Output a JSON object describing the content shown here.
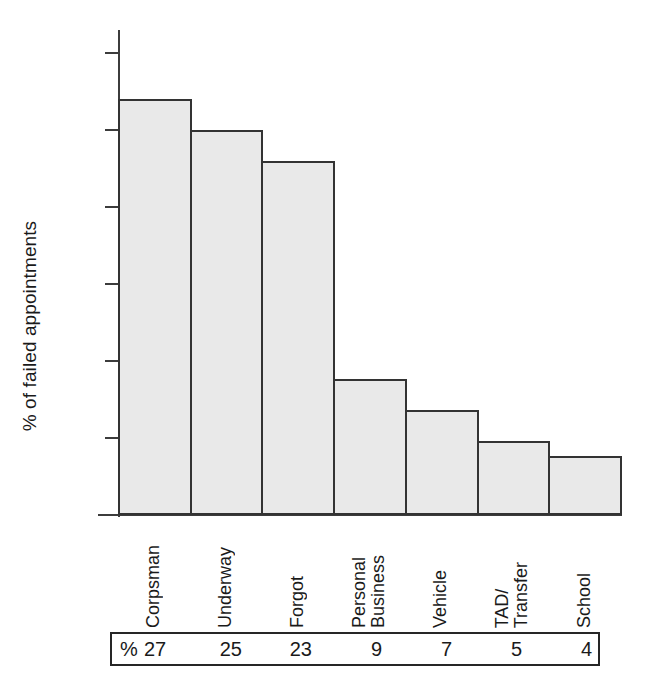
{
  "chart_data": {
    "type": "bar",
    "title": "",
    "subtitle": "",
    "xlabel": "",
    "ylabel": "% of failed appointments",
    "categories": [
      "Corpsman",
      "Underway",
      "Forgot",
      "Personal\nBusiness",
      "Vehicle",
      "TAD/\nTransfer",
      "School"
    ],
    "values": [
      27,
      25,
      23,
      8.8,
      6.8,
      4.8,
      3.8
    ],
    "ylim": [
      0,
      30
    ],
    "yticks": [
      0,
      5,
      10,
      15,
      20,
      25,
      30
    ],
    "ytick_labels": [
      "0",
      "5",
      "10",
      "15",
      "20",
      "25",
      "30"
    ],
    "grid": false,
    "legend": "none",
    "bar_fill_color": "#e9e9e9",
    "bar_edge_color": "#333333",
    "axis_color": "#3c3c3c",
    "background_color": "#ffffff"
  },
  "value_table": {
    "unit_symbol": "%",
    "values": [
      "27",
      "25",
      "23",
      "9",
      "7",
      "5",
      "4"
    ]
  }
}
